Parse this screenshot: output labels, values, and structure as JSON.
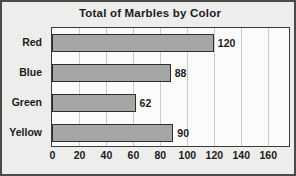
{
  "chart_data": {
    "type": "bar",
    "orientation": "horizontal",
    "title": "Total of Marbles by Color",
    "xlabel": "",
    "ylabel": "",
    "categories": [
      "Red",
      "Blue",
      "Green",
      "Yellow"
    ],
    "values": [
      120,
      88,
      62,
      90
    ],
    "value_labels": [
      "120",
      "88",
      "62",
      "90"
    ],
    "xlim": [
      0,
      175
    ],
    "xticks": [
      0,
      20,
      40,
      60,
      80,
      100,
      120,
      140,
      160
    ],
    "xtick_labels": [
      "0",
      "20",
      "40",
      "60",
      "80",
      "100",
      "120",
      "140",
      "160"
    ],
    "grid": "vertical",
    "legend": "none",
    "colors": {
      "bar_fill": "#a6a6a6",
      "bar_outline": "#2e2e2e",
      "plot_background": "#fbfbfb",
      "page_background": "#ededec",
      "gridline": "#c9c9c9",
      "frame": "#4a4a4a",
      "text": "#1b1b1b"
    }
  }
}
